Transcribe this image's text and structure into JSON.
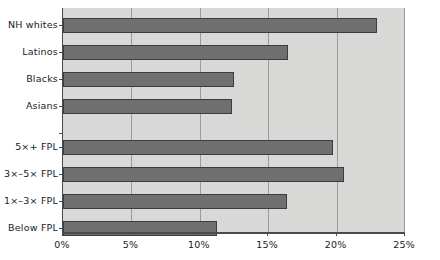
{
  "chart_data": {
    "type": "bar",
    "orientation": "horizontal",
    "title": "",
    "subtitle": "",
    "xlabel": "",
    "ylabel": "",
    "xlim": [
      0,
      25
    ],
    "xtick_labels": [
      "0%",
      "5%",
      "10%",
      "15%",
      "20%",
      "25%"
    ],
    "xtick_values": [
      0,
      5,
      10,
      15,
      20,
      25
    ],
    "grid": true,
    "legend": "none",
    "categories": [
      "NH whites",
      "Latinos",
      "Blacks",
      "Asians",
      "5×+ FPL",
      "3×–5× FPL",
      "1×–3× FPL",
      "Below FPL"
    ],
    "values": [
      23.0,
      16.5,
      12.5,
      12.4,
      19.8,
      20.6,
      16.4,
      11.3
    ],
    "bars": [
      {
        "label": "NH whites",
        "value": 23.0,
        "display": "23%",
        "group": "race-ethnicity"
      },
      {
        "label": "Latinos",
        "value": 16.5,
        "display": "16.5%",
        "group": "race-ethnicity"
      },
      {
        "label": "Blacks",
        "value": 12.5,
        "display": "12.5%",
        "group": "race-ethnicity"
      },
      {
        "label": "Asians",
        "value": 12.4,
        "display": "12.4%",
        "group": "race-ethnicity"
      },
      {
        "label": "5×+ FPL",
        "value": 19.8,
        "display": "19.8%",
        "group": "income"
      },
      {
        "label": "3×–5× FPL",
        "value": 20.6,
        "display": "20.6%",
        "group": "income"
      },
      {
        "label": "1×–3× FPL",
        "value": 16.4,
        "display": "16.4%",
        "group": "income"
      },
      {
        "label": "Below FPL",
        "value": 11.3,
        "display": "11.3%",
        "group": "income"
      }
    ],
    "colors": {
      "bar_fill": "#6f6f6f",
      "bar_border": "#3d3d3d",
      "plot_background": "#d8d8d6",
      "gridline": "#9b9b99",
      "axis": "#4a4a4a",
      "text": "#1a1a1a",
      "page_background": "#ffffff"
    }
  }
}
